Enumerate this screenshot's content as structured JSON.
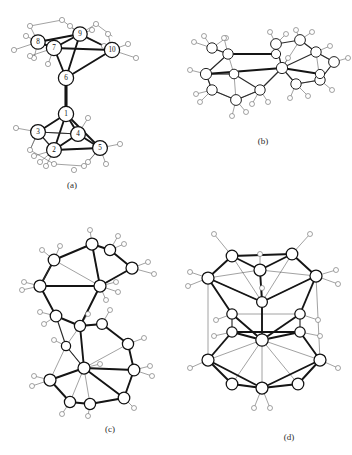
{
  "figure": {
    "background_color": "#ffffff",
    "ink_color": "#111111",
    "ligand_color": "#666666",
    "panels": [
      {
        "id": "a",
        "caption": "(a)",
        "description": "two tetrahedral metal clusters joined by a single vertical metal-metal bond",
        "labeled": true,
        "atom_labels": [
          "1",
          "2",
          "3",
          "4",
          "5",
          "6",
          "7",
          "8",
          "9",
          "10"
        ],
        "core_atom_count": 10,
        "ligand_count": 26
      },
      {
        "id": "b",
        "caption": "(b)",
        "description": "wide fused double-cage cluster viewed side-on",
        "labeled": false,
        "atom_labels": [],
        "core_atom_count": 16,
        "ligand_count": 24
      },
      {
        "id": "c",
        "caption": "(c)",
        "description": "two stacked polyhedral cages linked through a shared edge, staggered",
        "labeled": false,
        "atom_labels": [],
        "core_atom_count": 20,
        "ligand_count": 30
      },
      {
        "id": "d",
        "caption": "(d)",
        "description": "barrel-shaped closed polyhedral cluster with axial ligands",
        "labeled": false,
        "atom_labels": [],
        "core_atom_count": 18,
        "ligand_count": 26
      }
    ]
  }
}
